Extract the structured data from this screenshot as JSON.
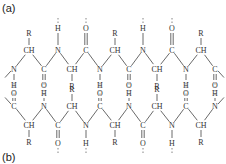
{
  "panels": [
    {
      "label": "(a)",
      "x": 2,
      "y": 12
    },
    {
      "label": "(b)",
      "x": 2,
      "y": 161
    }
  ],
  "colors": {
    "ink": "#333333",
    "background": "#ffffff"
  },
  "strands": {
    "top": {
      "atoms": [
        {
          "t": "N",
          "x": 14,
          "y": 69
        },
        {
          "t": "CH",
          "x": 29,
          "y": 50
        },
        {
          "t": "C",
          "x": 44,
          "y": 69
        },
        {
          "t": "N",
          "x": 58,
          "y": 50
        },
        {
          "t": "CH",
          "x": 72,
          "y": 69
        },
        {
          "t": "C",
          "x": 86,
          "y": 50
        },
        {
          "t": "N",
          "x": 100,
          "y": 69
        },
        {
          "t": "CH",
          "x": 115,
          "y": 50
        },
        {
          "t": "C",
          "x": 129,
          "y": 69
        },
        {
          "t": "N",
          "x": 143,
          "y": 50
        },
        {
          "t": "CH",
          "x": 157,
          "y": 69
        },
        {
          "t": "C",
          "x": 172,
          "y": 50
        },
        {
          "t": "N",
          "x": 186,
          "y": 69
        },
        {
          "t": "CH",
          "x": 201,
          "y": 50
        },
        {
          "t": "C",
          "x": 215,
          "y": 69
        }
      ],
      "subs": [
        {
          "t": "H",
          "x": 14,
          "y": 85,
          "from": 0,
          "dir": "down"
        },
        {
          "t": "R",
          "x": 29,
          "y": 33,
          "from": 1,
          "dir": "up"
        },
        {
          "t": "O",
          "x": 44,
          "y": 85,
          "from": 2,
          "dir": "down",
          "double": true
        },
        {
          "t": "H",
          "x": 58,
          "y": 28,
          "from": 3,
          "dir": "up"
        },
        {
          "t": "R",
          "x": 72,
          "y": 86,
          "from": 4,
          "dir": "down"
        },
        {
          "t": "O",
          "x": 86,
          "y": 28,
          "from": 5,
          "dir": "up",
          "double": true
        },
        {
          "t": "H",
          "x": 100,
          "y": 85,
          "from": 6,
          "dir": "down"
        },
        {
          "t": "R",
          "x": 115,
          "y": 33,
          "from": 7,
          "dir": "up"
        },
        {
          "t": "O",
          "x": 129,
          "y": 85,
          "from": 8,
          "dir": "down",
          "double": true
        },
        {
          "t": "H",
          "x": 143,
          "y": 28,
          "from": 9,
          "dir": "up"
        },
        {
          "t": "R",
          "x": 157,
          "y": 86,
          "from": 10,
          "dir": "down"
        },
        {
          "t": "O",
          "x": 172,
          "y": 28,
          "from": 11,
          "dir": "up",
          "double": true
        },
        {
          "t": "H",
          "x": 186,
          "y": 85,
          "from": 12,
          "dir": "down"
        },
        {
          "t": "R",
          "x": 201,
          "y": 33,
          "from": 13,
          "dir": "up"
        },
        {
          "t": "O",
          "x": 215,
          "y": 85,
          "from": 14,
          "dir": "down",
          "double": true
        }
      ]
    },
    "bottom": {
      "atoms": [
        {
          "t": "C",
          "x": 14,
          "y": 106
        },
        {
          "t": "CH",
          "x": 29,
          "y": 125
        },
        {
          "t": "N",
          "x": 44,
          "y": 106
        },
        {
          "t": "C",
          "x": 58,
          "y": 125
        },
        {
          "t": "CH",
          "x": 72,
          "y": 106
        },
        {
          "t": "N",
          "x": 86,
          "y": 125
        },
        {
          "t": "C",
          "x": 100,
          "y": 106
        },
        {
          "t": "CH",
          "x": 115,
          "y": 125
        },
        {
          "t": "N",
          "x": 129,
          "y": 106
        },
        {
          "t": "C",
          "x": 143,
          "y": 125
        },
        {
          "t": "CH",
          "x": 157,
          "y": 106
        },
        {
          "t": "N",
          "x": 172,
          "y": 125
        },
        {
          "t": "C",
          "x": 186,
          "y": 106
        },
        {
          "t": "CH",
          "x": 201,
          "y": 125
        },
        {
          "t": "N",
          "x": 215,
          "y": 106
        }
      ],
      "subs": [
        {
          "t": "O",
          "x": 14,
          "y": 93,
          "from": 0,
          "dir": "up",
          "double": true
        },
        {
          "t": "R",
          "x": 29,
          "y": 142,
          "from": 1,
          "dir": "down"
        },
        {
          "t": "H",
          "x": 44,
          "y": 93,
          "from": 2,
          "dir": "up"
        },
        {
          "t": "O",
          "x": 58,
          "y": 143,
          "from": 3,
          "dir": "down",
          "double": true
        },
        {
          "t": "R",
          "x": 72,
          "y": 89,
          "from": 4,
          "dir": "up"
        },
        {
          "t": "H",
          "x": 86,
          "y": 143,
          "from": 5,
          "dir": "down"
        },
        {
          "t": "O",
          "x": 100,
          "y": 93,
          "from": 6,
          "dir": "up",
          "double": true
        },
        {
          "t": "R",
          "x": 115,
          "y": 142,
          "from": 7,
          "dir": "down"
        },
        {
          "t": "H",
          "x": 129,
          "y": 93,
          "from": 8,
          "dir": "up"
        },
        {
          "t": "O",
          "x": 143,
          "y": 143,
          "from": 9,
          "dir": "down",
          "double": true
        },
        {
          "t": "R",
          "x": 157,
          "y": 89,
          "from": 10,
          "dir": "up"
        },
        {
          "t": "H",
          "x": 172,
          "y": 143,
          "from": 11,
          "dir": "down"
        },
        {
          "t": "O",
          "x": 186,
          "y": 93,
          "from": 12,
          "dir": "up",
          "double": true
        },
        {
          "t": "R",
          "x": 201,
          "y": 142,
          "from": 13,
          "dir": "down"
        },
        {
          "t": "H",
          "x": 215,
          "y": 93,
          "from": 14,
          "dir": "up"
        }
      ]
    }
  }
}
